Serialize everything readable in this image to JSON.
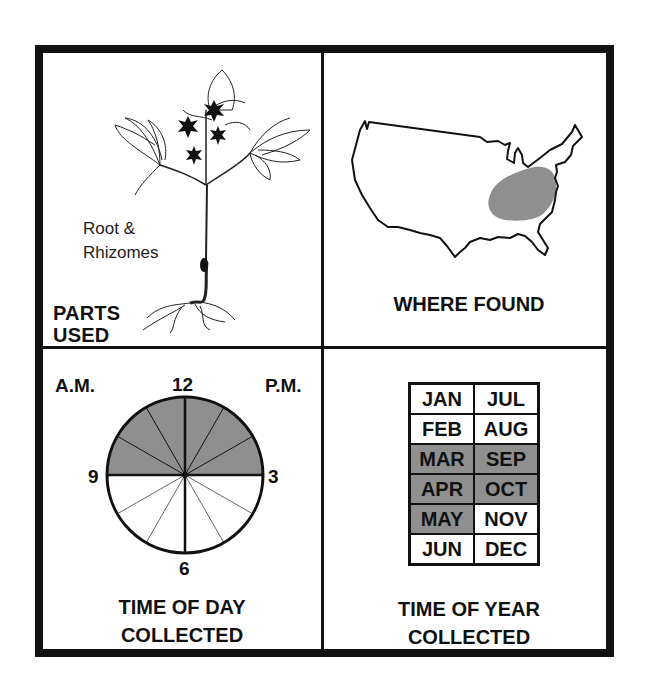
{
  "panels": {
    "parts_used": {
      "title_line1": "PARTS",
      "title_line2": "USED",
      "part_line1": "Root &",
      "part_line2": "Rhizomes",
      "illustration": "plant-with-star-flowers-and-roots"
    },
    "where_found": {
      "title": "WHERE FOUND",
      "illustration": "us-map-outline",
      "highlighted_region": "eastern-central United States (Appalachian / Ohio Valley area)",
      "highlight_color": "#8f8f8f"
    },
    "time_of_day": {
      "title_line1": "TIME OF DAY",
      "title_line2": "COLLECTED",
      "am_label": "A.M.",
      "pm_label": "P.M.",
      "clock_labels": {
        "top": "12",
        "right": "3",
        "bottom": "6",
        "left": "9"
      },
      "shaded_range": "9 to 3 (upper half)",
      "shade_color": "#8f8f8f"
    },
    "time_of_year": {
      "title_line1": "TIME OF YEAR",
      "title_line2": "COLLECTED",
      "rows": [
        [
          {
            "m": "JAN",
            "on": false
          },
          {
            "m": "JUL",
            "on": false
          }
        ],
        [
          {
            "m": "FEB",
            "on": false
          },
          {
            "m": "AUG",
            "on": false
          }
        ],
        [
          {
            "m": "MAR",
            "on": true
          },
          {
            "m": "SEP",
            "on": true
          }
        ],
        [
          {
            "m": "APR",
            "on": true
          },
          {
            "m": "OCT",
            "on": true
          }
        ],
        [
          {
            "m": "MAY",
            "on": true
          },
          {
            "m": "NOV",
            "on": false
          }
        ],
        [
          {
            "m": "JUN",
            "on": false
          },
          {
            "m": "DEC",
            "on": false
          }
        ]
      ]
    }
  }
}
